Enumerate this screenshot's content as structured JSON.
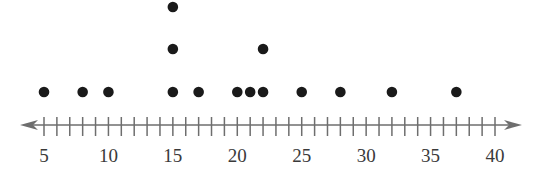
{
  "chart_data": {
    "type": "scatter",
    "subtype": "dot_plot",
    "title": "",
    "xlabel": "",
    "ylabel": "",
    "xlim": [
      5,
      40
    ],
    "tick_step": 1,
    "tick_labels": [
      5,
      10,
      15,
      20,
      25,
      30,
      35,
      40
    ],
    "grid": false,
    "legend": null,
    "axis_arrows": "both",
    "values": [
      5,
      8,
      10,
      15,
      15,
      15,
      17,
      20,
      21,
      22,
      22,
      25,
      28,
      32,
      37
    ],
    "counts": {
      "5": 1,
      "8": 1,
      "10": 1,
      "15": 3,
      "17": 1,
      "20": 1,
      "21": 1,
      "22": 2,
      "25": 1,
      "28": 1,
      "32": 1,
      "37": 1
    }
  },
  "colors": {
    "dot": "#1a1a1a",
    "axis": "#6e6e6e",
    "label": "#3a3a3a"
  }
}
